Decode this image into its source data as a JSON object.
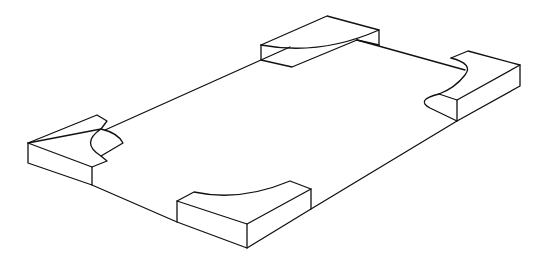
{
  "figure": {
    "stroke_color": "#111111",
    "background": "#ffffff"
  },
  "components": {
    "plate": "rectangular-plate",
    "blocks": [
      "block-top",
      "block-left",
      "block-right",
      "block-bottom"
    ]
  }
}
